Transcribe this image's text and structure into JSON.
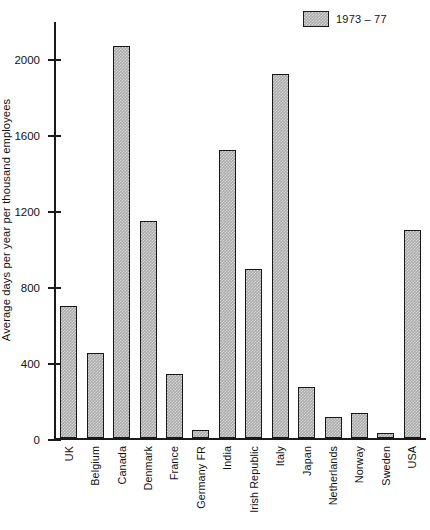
{
  "chart_data": {
    "type": "bar",
    "title": "",
    "xlabel": "",
    "ylabel": "Average days per year per thousand employees",
    "ylim": [
      0,
      2200
    ],
    "grid": false,
    "legend_position": "top-right",
    "yticks": [
      {
        "value": 0,
        "label": "0"
      },
      {
        "value": 400,
        "label": "400"
      },
      {
        "value": 800,
        "label": "800"
      },
      {
        "value": 1200,
        "label": "1200"
      },
      {
        "value": 1600,
        "label": "1600"
      },
      {
        "value": 2000,
        "label": "2000"
      }
    ],
    "categories": [
      "UK",
      "Belgium",
      "Canada",
      "Denmark",
      "France",
      "Germany FR",
      "India",
      "Irish Republic",
      "Italy",
      "Japan",
      "Netherlands",
      "Norway",
      "Sweden",
      "USA"
    ],
    "series": [
      {
        "name": "1973 – 77",
        "color": "#a9a9a9",
        "values": [
          695,
          450,
          2065,
          1145,
          340,
          45,
          1520,
          890,
          1920,
          270,
          115,
          135,
          30,
          1095
        ]
      }
    ]
  },
  "legend": {
    "entries": [
      {
        "label": "1973 – 77",
        "swatch": "hatched-grey"
      }
    ]
  }
}
